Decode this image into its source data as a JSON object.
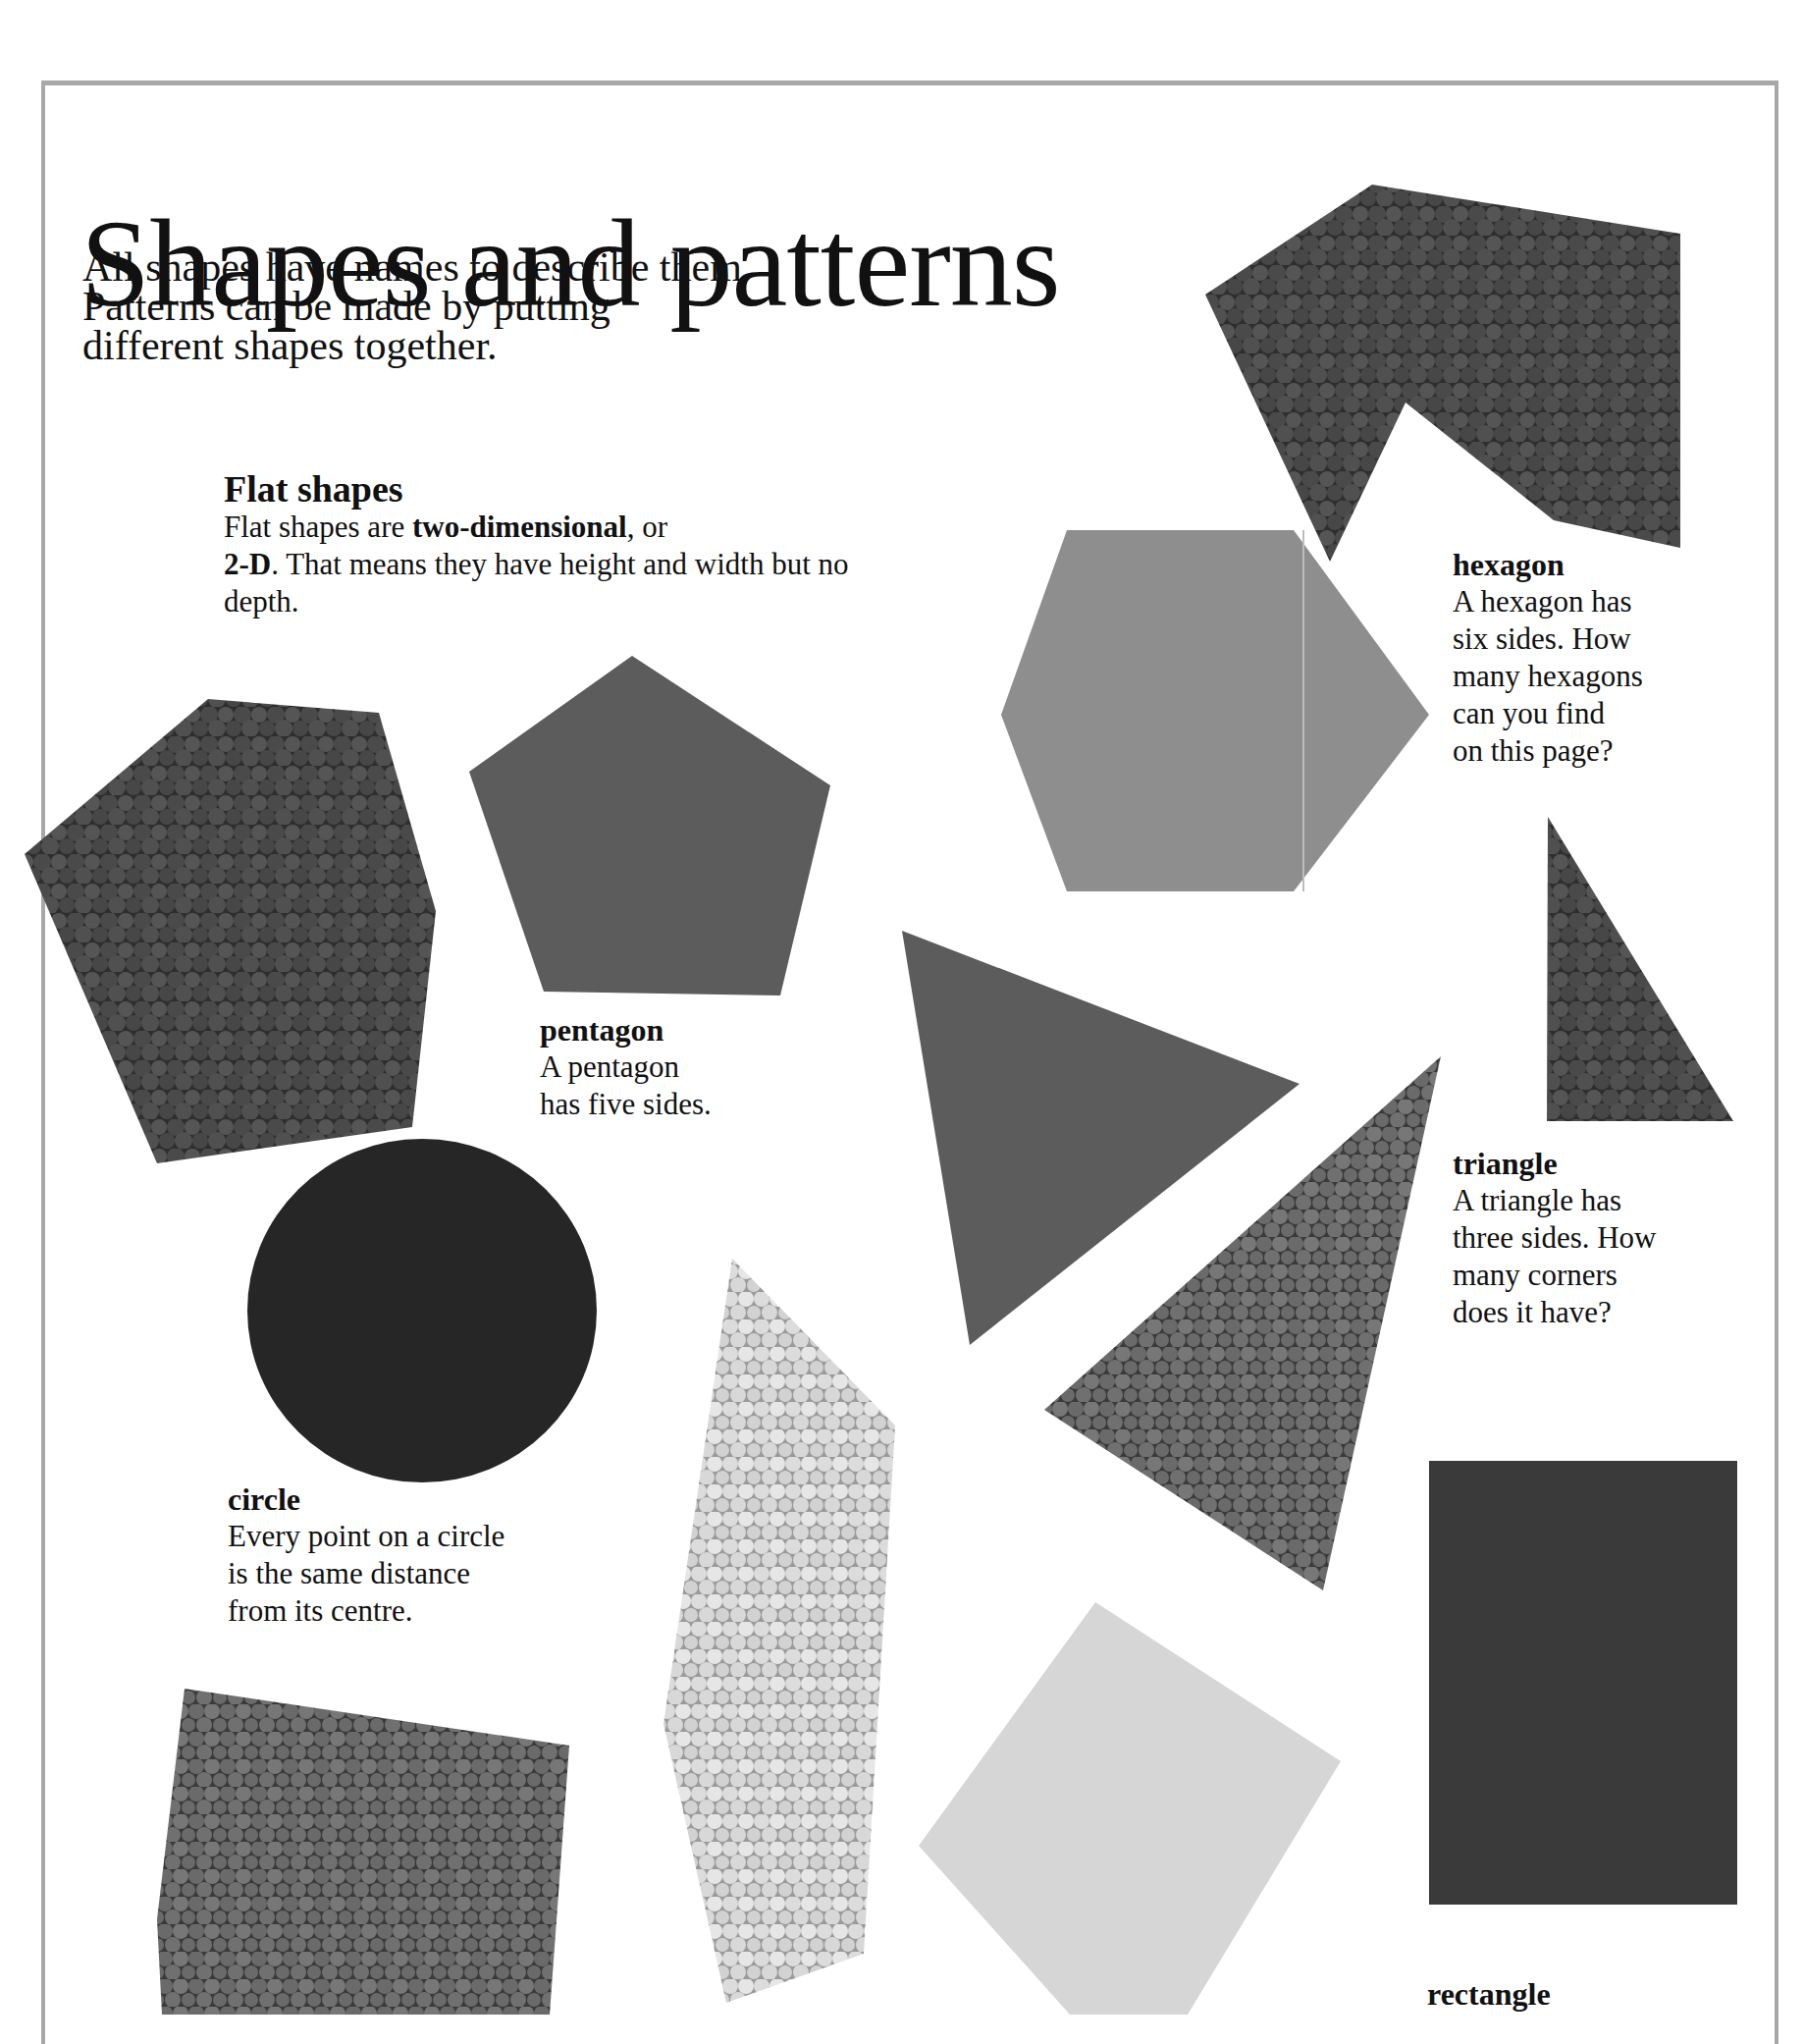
{
  "page": {
    "title": "Shapes and patterns",
    "intro_lines": [
      "All shapes have names to describe them.",
      "Patterns can be made by putting",
      "different shapes together."
    ]
  },
  "section": {
    "heading": "Flat shapes",
    "body_parts": {
      "p1": "Flat shapes are ",
      "bold1": "two-dimensional",
      "p2": ", or",
      "bold2": "2-D",
      "p3": ". That means they have height and width but no depth."
    }
  },
  "shapes": {
    "hexagon": {
      "name": "hexagon",
      "lines": [
        "A hexagon has",
        "six sides. How",
        "many hexagons",
        "can you find",
        "on this page?"
      ]
    },
    "pentagon": {
      "name": "pentagon",
      "lines": [
        "A pentagon",
        "has five sides."
      ]
    },
    "triangle": {
      "name": "triangle",
      "lines": [
        "A triangle has",
        "three sides. How",
        "many corners",
        "does it have?"
      ]
    },
    "circle": {
      "name": "circle",
      "lines": [
        "Every point on a circle",
        "is the same distance",
        "from its centre."
      ]
    },
    "rectangle": {
      "name": "rectangle"
    }
  },
  "colors": {
    "frame": "#a8a8a8",
    "crumpled_dark": "#3e3e3e",
    "crumpled_mid": "#5a5a5a",
    "crumpled_light": "#cfcfcf",
    "felt_light": "#8e8e8e",
    "felt_mid": "#5c5c5c",
    "felt_dark": "#3a3a3a",
    "circle": "#262626",
    "pale_square": "#d6d6d6"
  }
}
